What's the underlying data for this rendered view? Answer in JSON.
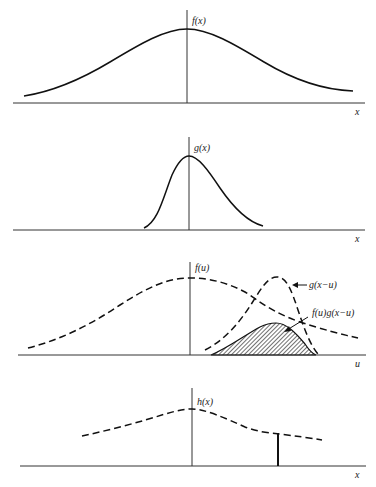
{
  "figure": {
    "panels": [
      {
        "id": "f",
        "function_label": "f(x)",
        "axis_label": "x",
        "curve_style": "solid",
        "description": "Broad bell-shaped function"
      },
      {
        "id": "g",
        "function_label": "g(x)",
        "axis_label": "x",
        "curve_style": "solid",
        "description": "Narrow, right-skewed bell-shaped function"
      },
      {
        "id": "product",
        "function_label": "f(u)",
        "axis_label": "u",
        "curve_style": "dashed",
        "annotations": [
          {
            "text": "g(x−u)",
            "arrow": true
          },
          {
            "text": "f(u)g(x−u)",
            "arrow": true
          }
        ],
        "shaded_region": "f(u)g(x−u)",
        "description": "f(u) and shifted/reflected g(x−u) with shaded product"
      },
      {
        "id": "h",
        "function_label": "h(x)",
        "axis_label": "x",
        "curve_style": "dashed",
        "marker": "vertical line at the chosen x, height h(x)",
        "description": "Convolution result h(x)"
      }
    ]
  },
  "colors": {
    "ink": "#111111",
    "axis": "#333333",
    "hatch": "#333333",
    "background": "#ffffff"
  }
}
